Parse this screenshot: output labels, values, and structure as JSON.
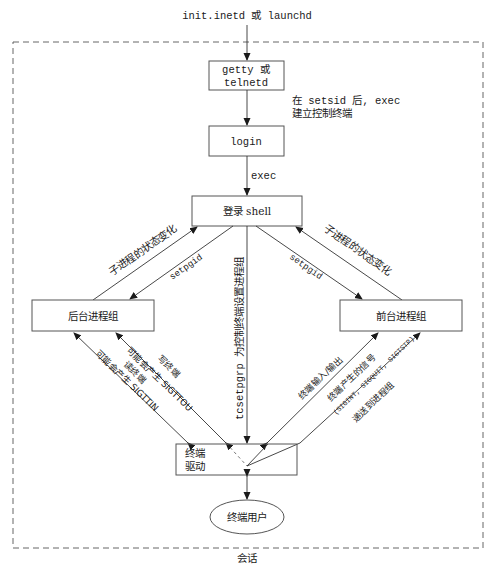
{
  "diagram": {
    "top_label": "init.inetd 或 launchd",
    "session_label": "会话",
    "nodes": {
      "getty": {
        "line1": "getty 或",
        "line2": "telnetd"
      },
      "login": {
        "label": "login"
      },
      "login_shell": {
        "label": "登录 shell"
      },
      "background_group": {
        "label": "后台进程组"
      },
      "foreground_group": {
        "label": "前台进程组"
      },
      "terminal_driver": {
        "line1": "终端",
        "line2": "驱动"
      },
      "terminal_user": {
        "label": "终端用户"
      }
    },
    "edges": {
      "getty_to_login": {
        "line1": "在 setsid 后, exec",
        "line2": "建立控制终端"
      },
      "login_to_shell": {
        "label": "exec"
      },
      "bg_to_shell": {
        "label": "子进程的状态变化"
      },
      "shell_to_bg": {
        "label": "setpgid"
      },
      "shell_to_fg": {
        "label": "setpgid"
      },
      "fg_to_shell": {
        "label": "子进程的状态变化"
      },
      "shell_to_driver": {
        "label": "tcsetpgrp 为控制终端设置进程组"
      },
      "driver_to_bg_read": {
        "label": "可能会产生 SIGTTIN"
      },
      "driver_to_bg_read_note": {
        "label": "读终端"
      },
      "driver_to_bg_write": {
        "label": "可能会产生 SIGTTOU"
      },
      "driver_to_bg_write_note": {
        "label": "写终端"
      },
      "fg_io": {
        "label": "终端输入/输出"
      },
      "fg_signals": {
        "line1": "终端产生的信号",
        "line2": "(SIGINT, SIGQUIT, SIGTSTP)",
        "line3": "递送到进程组"
      }
    }
  }
}
